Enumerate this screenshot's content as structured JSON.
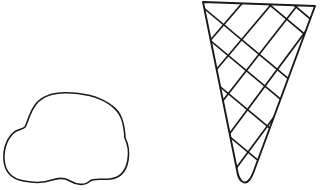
{
  "scene": {
    "description": "Line drawing of an ice cream scoop and a waffle cone, separated",
    "stroke_color": "#1a1a1a",
    "background": "#ffffff",
    "objects": [
      {
        "name": "ice-cream-scoop",
        "shape": "blob outline"
      },
      {
        "name": "waffle-cone",
        "shape": "inverted triangle with crosshatch"
      }
    ]
  }
}
